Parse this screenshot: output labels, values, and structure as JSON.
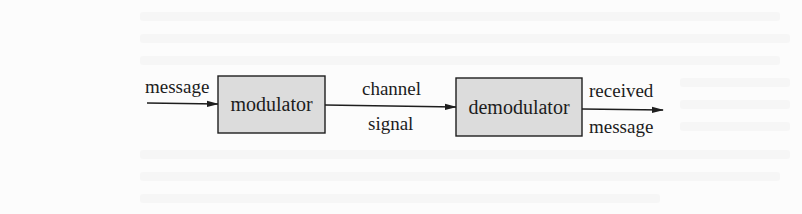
{
  "diagram": {
    "type": "block-diagram",
    "colors": {
      "block_fill": "#dcdcdc",
      "stroke": "#1e1e1e",
      "background": "#fcfcfc"
    },
    "input_label": "message",
    "blocks": [
      {
        "id": "modulator",
        "label": "modulator"
      },
      {
        "id": "demodulator",
        "label": "demodulator"
      }
    ],
    "channel_label_top": "channel",
    "channel_label_bottom": "signal",
    "output_label_top": "received",
    "output_label_bottom": "message",
    "edges": [
      {
        "from": "input",
        "to": "modulator",
        "label": "message"
      },
      {
        "from": "modulator",
        "to": "demodulator",
        "label": "channel signal"
      },
      {
        "from": "demodulator",
        "to": "output",
        "label": "received message"
      }
    ]
  }
}
